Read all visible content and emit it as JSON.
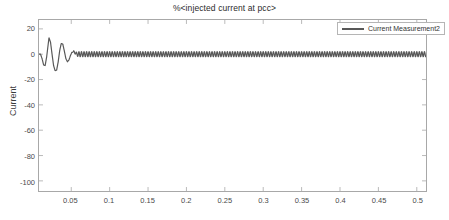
{
  "figure": {
    "title": "%<injected current at pcc>",
    "background_color": "#ffffff",
    "axes_border_color": "#a8a8a8"
  },
  "legend": {
    "position": "top-right",
    "entries": [
      {
        "label": "Current Measurement2",
        "color": "#585858"
      }
    ]
  },
  "chart_data": {
    "type": "line",
    "title": "%<injected current at pcc>",
    "xlabel": "",
    "ylabel": "Current",
    "xlim": [
      0.008,
      0.512
    ],
    "ylim": [
      -108,
      27
    ],
    "grid": false,
    "legend_position": "top-right",
    "xticks": [
      0.05,
      0.1,
      0.15,
      0.2,
      0.25,
      0.3,
      0.35,
      0.4,
      0.45,
      0.5
    ],
    "xtick_labels": [
      "0.05",
      "0.1",
      "0.15",
      "0.2",
      "0.25",
      "0.3",
      "0.35",
      "0.4",
      "0.45",
      "0.5"
    ],
    "yticks": [
      20,
      0,
      -20,
      -40,
      -60,
      -80,
      -100
    ],
    "ytick_labels": [
      "20",
      "0",
      "-20",
      "-40",
      "-60",
      "-80",
      "-100"
    ],
    "series": [
      {
        "name": "Current Measurement2",
        "color": "#585858",
        "line_width": 1.2,
        "description": "Damped oscillatory inverter injected current: large startup transient peaking near +13 A at t=0.021 s and -13 A at t=0.031 s, decaying within ~0.06 s into a persistent low-amplitude ripple of about +/-2 A centered on 0 A for the remainder of the run.",
        "x": [
          0.01,
          0.012,
          0.014,
          0.016,
          0.018,
          0.02,
          0.021,
          0.023,
          0.025,
          0.027,
          0.029,
          0.031,
          0.033,
          0.035,
          0.037,
          0.039,
          0.041,
          0.043,
          0.045,
          0.047,
          0.049,
          0.051,
          0.053,
          0.055,
          0.057,
          0.06,
          0.065,
          0.07,
          0.075,
          0.08,
          0.09,
          0.1,
          0.12,
          0.15,
          0.2,
          0.25,
          0.3,
          0.35,
          0.4,
          0.45,
          0.5,
          0.511
        ],
        "y": [
          0.0,
          -3.5,
          -8.5,
          -9.0,
          -2.0,
          8.0,
          13.0,
          9.5,
          0.0,
          -9.0,
          -13.0,
          -12.5,
          -6.0,
          3.0,
          8.5,
          8.0,
          2.5,
          -3.5,
          -6.0,
          -4.5,
          -1.0,
          1.8,
          3.0,
          2.4,
          0.6,
          -1.8,
          1.9,
          -1.9,
          1.9,
          -1.9,
          1.9,
          -1.9,
          1.9,
          -1.9,
          1.9,
          -1.9,
          1.9,
          -1.9,
          1.9,
          -1.9,
          1.9,
          1.0
        ],
        "steady_state_amplitude": 2.0,
        "steady_state_mean": 0.0,
        "ripple_frequency_hz": 300
      }
    ]
  }
}
